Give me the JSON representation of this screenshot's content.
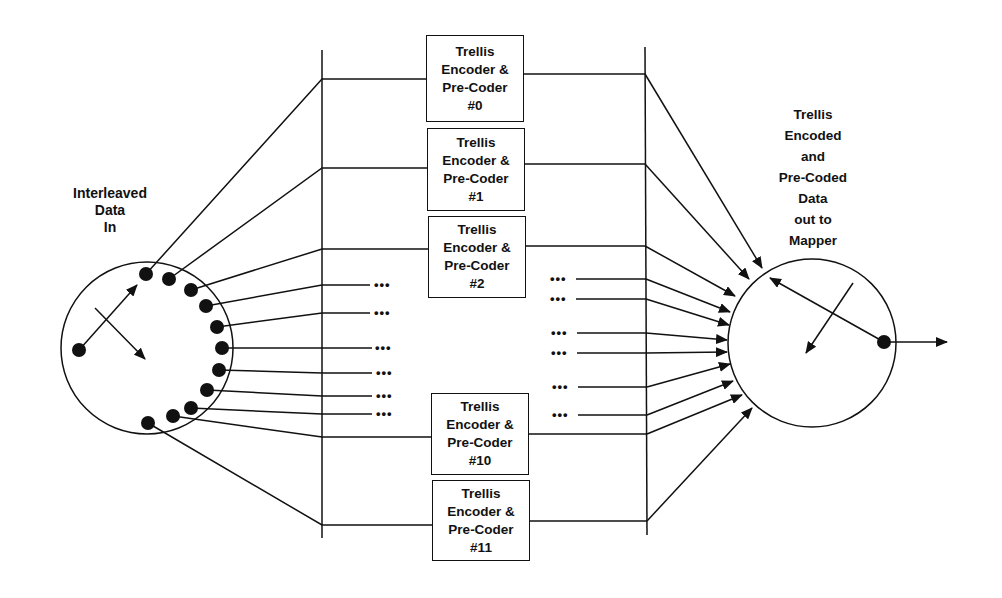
{
  "diagram": {
    "input_label": [
      "Interleaved",
      "Data",
      "In"
    ],
    "output_label": [
      "Trellis",
      "Encoded",
      "and",
      "Pre-Coded",
      "Data",
      "out to",
      "Mapper"
    ],
    "encoders": [
      {
        "line1": "Trellis",
        "line2": "Encoder &",
        "line3": "Pre-Coder",
        "id": "#0"
      },
      {
        "line1": "Trellis",
        "line2": "Encoder &",
        "line3": "Pre-Coder",
        "id": "#1"
      },
      {
        "line1": "Trellis",
        "line2": "Encoder &",
        "line3": "Pre-Coder",
        "id": "#2"
      },
      {
        "line1": "Trellis",
        "line2": "Encoder &",
        "line3": "Pre-Coder",
        "id": "#10"
      },
      {
        "line1": "Trellis",
        "line2": "Encoder &",
        "line3": "Pre-Coder",
        "id": "#11"
      }
    ],
    "ellipsis": "•••",
    "input_commutator_taps": 12,
    "output_commutator_inputs": 12,
    "line_color": "#111111"
  }
}
